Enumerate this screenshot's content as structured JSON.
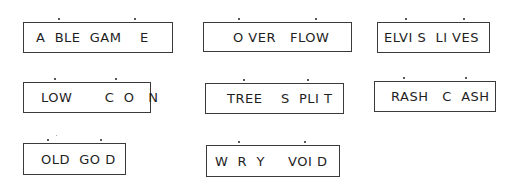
{
  "puzzles": [
    {
      "text": "A  BLE  GAM    E",
      "box": [
        23,
        22,
        150,
        31
      ],
      "pad": 12,
      "dots": [
        59,
        135
      ]
    },
    {
      "text": "O VER   FLOW",
      "box": [
        203,
        22,
        149,
        30
      ],
      "pad": 29,
      "dots": [
        239,
        316
      ]
    },
    {
      "text": "ELVI S  LI VES",
      "box": [
        377,
        22,
        113,
        31
      ],
      "pad": 6,
      "dots": [
        406,
        464
      ]
    },
    {
      "text": "LOW       C  O   N",
      "box": [
        23,
        82,
        128,
        31
      ],
      "pad": 17,
      "dots": [
        55,
        116
      ]
    },
    {
      "text": "TREE    S  PLI T",
      "box": [
        205,
        83,
        139,
        31
      ],
      "pad": 21,
      "dots": [
        244,
        308
      ]
    },
    {
      "text": "RASH   C  ASH",
      "box": [
        374,
        81,
        122,
        31
      ],
      "pad": 16,
      "dots": [
        404,
        466
      ]
    },
    {
      "text": "OLD  GO D",
      "box": [
        23,
        143,
        103,
        32
      ],
      "pad": 17,
      "dots": [
        48,
        101
      ]
    },
    {
      "text": "W  R  Y     VOI D",
      "box": [
        206,
        145,
        134,
        32
      ],
      "pad": 8,
      "dots": [
        239,
        305
      ]
    }
  ]
}
